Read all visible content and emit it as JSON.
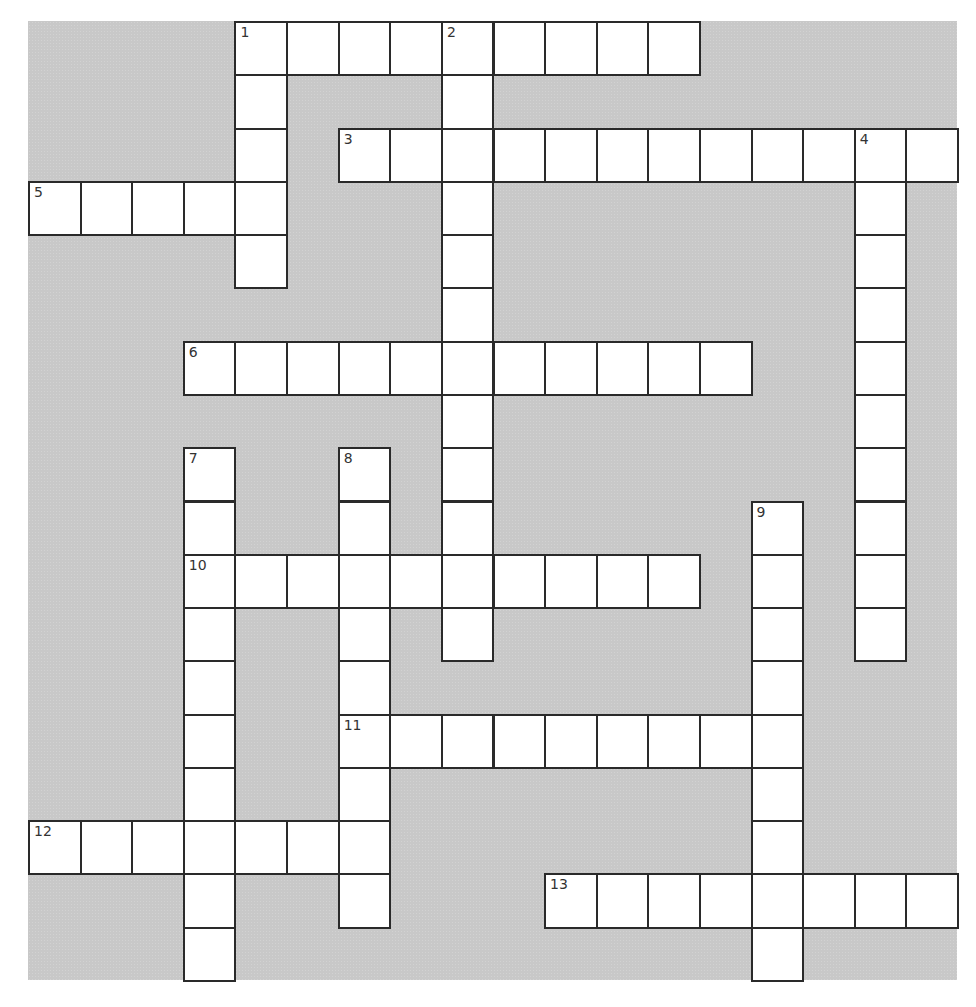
{
  "puzzle": {
    "type": "crossword",
    "columns": 18,
    "rows": 18,
    "colors": {
      "background": "#c8c8c8",
      "cell": "#ffffff",
      "border": "#2a2a2a",
      "number": "#333333"
    },
    "entries": [
      {
        "number": "1",
        "direction": "across",
        "row": 0,
        "col": 4,
        "length": 9
      },
      {
        "number": "1",
        "direction": "down",
        "row": 0,
        "col": 4,
        "length": 5
      },
      {
        "number": "2",
        "direction": "down",
        "row": 0,
        "col": 8,
        "length": 12
      },
      {
        "number": "3",
        "direction": "across",
        "row": 2,
        "col": 6,
        "length": 12
      },
      {
        "number": "4",
        "direction": "down",
        "row": 2,
        "col": 16,
        "length": 10
      },
      {
        "number": "5",
        "direction": "across",
        "row": 3,
        "col": 0,
        "length": 5
      },
      {
        "number": "6",
        "direction": "across",
        "row": 6,
        "col": 3,
        "length": 11
      },
      {
        "number": "7",
        "direction": "down",
        "row": 8,
        "col": 3,
        "length": 10
      },
      {
        "number": "8",
        "direction": "down",
        "row": 8,
        "col": 6,
        "length": 9
      },
      {
        "number": "9",
        "direction": "down",
        "row": 9,
        "col": 14,
        "length": 9
      },
      {
        "number": "10",
        "direction": "across",
        "row": 10,
        "col": 3,
        "length": 10
      },
      {
        "number": "11",
        "direction": "across",
        "row": 13,
        "col": 6,
        "length": 9
      },
      {
        "number": "12",
        "direction": "across",
        "row": 15,
        "col": 0,
        "length": 7
      },
      {
        "number": "13",
        "direction": "across",
        "row": 16,
        "col": 10,
        "length": 8
      }
    ]
  }
}
